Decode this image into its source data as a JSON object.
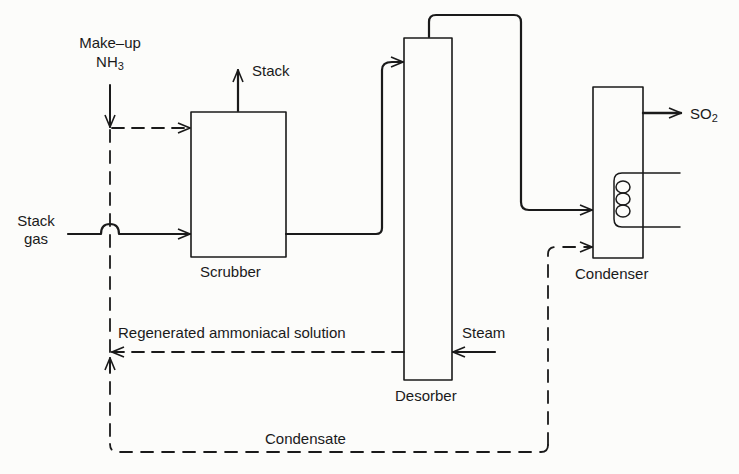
{
  "diagram": {
    "type": "process-flow",
    "units": [
      {
        "id": "scrubber",
        "label": "Scrubber"
      },
      {
        "id": "desorber",
        "label": "Desorber"
      },
      {
        "id": "condenser",
        "label": "Condenser"
      }
    ],
    "labels": {
      "makeup_line1": "Make–up",
      "makeup_nh": "NH",
      "makeup_sub": "3",
      "stack_out": "Stack",
      "stack_gas_line1": "Stack",
      "stack_gas_line2": "gas",
      "so2_main": "SO",
      "so2_sub": "2",
      "regenerated": "Regenerated ammoniacal solution",
      "steam": "Steam",
      "condensate": "Condensate"
    },
    "flows": [
      {
        "from": "Make-up NH3",
        "to": "scrubber",
        "style": "dashed"
      },
      {
        "from": "Stack gas",
        "to": "scrubber",
        "style": "solid"
      },
      {
        "from": "scrubber",
        "to": "Stack",
        "style": "solid"
      },
      {
        "from": "scrubber",
        "to": "desorber",
        "style": "solid"
      },
      {
        "from": "desorber",
        "to": "condenser",
        "style": "solid"
      },
      {
        "from": "condenser",
        "to": "SO2",
        "style": "solid"
      },
      {
        "from": "Steam",
        "to": "desorber",
        "style": "solid"
      },
      {
        "from": "desorber",
        "to": "Make-up line",
        "label": "Regenerated ammoniacal solution",
        "style": "dashed"
      },
      {
        "from": "condenser",
        "to": "Make-up line",
        "label": "Condensate",
        "style": "dashed"
      }
    ]
  }
}
